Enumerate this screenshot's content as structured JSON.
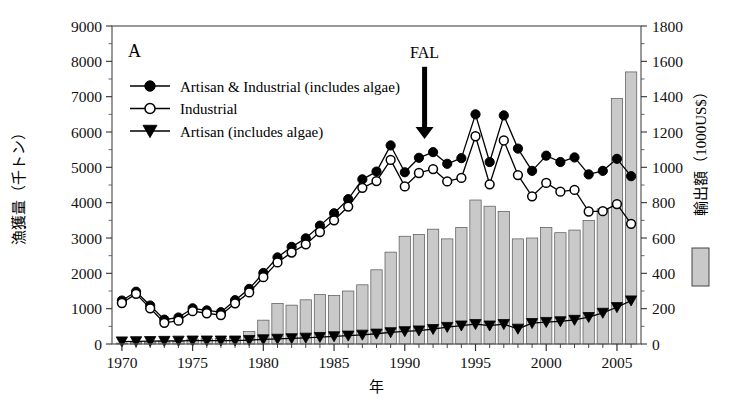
{
  "chart_data": {
    "type": "line",
    "panel_label": "A",
    "title": "",
    "xlabel": "年",
    "ylabel": "漁獲量（千トン）",
    "y2label": "輸出額（1000US$）",
    "xlim": [
      1969.3,
      2006.7
    ],
    "ylim": [
      0,
      9000
    ],
    "y2lim": [
      0,
      1800
    ],
    "yticks": [
      0,
      1000,
      2000,
      3000,
      4000,
      5000,
      6000,
      7000,
      8000,
      9000
    ],
    "y2ticks": [
      0,
      200,
      400,
      600,
      800,
      1000,
      1200,
      1400,
      1600,
      1800
    ],
    "xticks": [
      1970,
      1975,
      1980,
      1985,
      1990,
      1995,
      2000,
      2005
    ],
    "xtick_labels": [
      "1970",
      "1975",
      "1980",
      "1985",
      "1990",
      "1995",
      "2000",
      "2005"
    ],
    "grid": false,
    "legend_position": "upper-left",
    "x": [
      1970,
      1971,
      1972,
      1973,
      1974,
      1975,
      1976,
      1977,
      1978,
      1979,
      1980,
      1981,
      1982,
      1983,
      1984,
      1985,
      1986,
      1987,
      1988,
      1989,
      1990,
      1991,
      1992,
      1993,
      1994,
      1995,
      1996,
      1997,
      1998,
      1999,
      2000,
      2001,
      2002,
      2003,
      2004,
      2005,
      2006
    ],
    "series": [
      {
        "name": "Artisan & Industrial (includes algae)",
        "axis": "left",
        "marker": "filled-circle",
        "color": "#000000",
        "values": [
          1230,
          1480,
          1090,
          690,
          750,
          1010,
          950,
          900,
          1240,
          1560,
          2010,
          2450,
          2750,
          2990,
          3350,
          3700,
          4100,
          4660,
          4880,
          5620,
          4860,
          5270,
          5430,
          5100,
          5260,
          6500,
          5150,
          6470,
          5530,
          4900,
          5330,
          5150,
          5280,
          4800,
          4900,
          5240,
          4750
        ]
      },
      {
        "name": "Industrial",
        "axis": "left",
        "marker": "open-circle",
        "color": "#000000",
        "values": [
          1160,
          1420,
          1010,
          600,
          660,
          930,
          870,
          820,
          1150,
          1460,
          1890,
          2310,
          2590,
          2820,
          3170,
          3500,
          3890,
          4420,
          4610,
          5210,
          4460,
          4840,
          4950,
          4600,
          4700,
          5880,
          4520,
          5760,
          4780,
          4180,
          4560,
          4310,
          4360,
          3750,
          3760,
          3960,
          3400
        ]
      },
      {
        "name": "Artisan (includes algae)",
        "axis": "left",
        "marker": "filled-triangle-down",
        "color": "#000000",
        "values": [
          70,
          75,
          80,
          85,
          90,
          95,
          95,
          95,
          95,
          110,
          130,
          145,
          160,
          175,
          195,
          215,
          235,
          260,
          290,
          330,
          360,
          380,
          420,
          480,
          520,
          560,
          520,
          560,
          430,
          590,
          620,
          640,
          680,
          760,
          880,
          1040,
          1230
        ]
      }
    ],
    "bars": {
      "name": "輸出額（1000US$）",
      "axis": "right",
      "color": "#c9c9c9",
      "edge_color": "#555555",
      "values": [
        5,
        10,
        10,
        12,
        14,
        28,
        30,
        32,
        36,
        70,
        135,
        230,
        220,
        250,
        280,
        275,
        300,
        335,
        420,
        520,
        610,
        620,
        650,
        595,
        660,
        815,
        780,
        750,
        595,
        600,
        660,
        630,
        645,
        700,
        765,
        1390,
        1540
      ]
    },
    "annotations": [
      {
        "text": "FAL",
        "x": 1991.4,
        "y": 8100,
        "arrow": "down",
        "arrow_tip_y": 5800
      }
    ]
  }
}
